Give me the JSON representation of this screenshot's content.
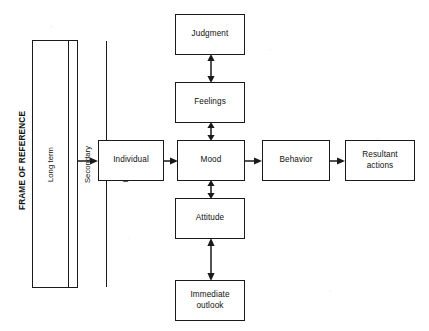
{
  "diagram": {
    "background_color": "#ffffff",
    "line_color": "#1a1a1a",
    "box_fill": "#ffffff",
    "frame": {
      "label": "FRAME OF REFERENCE",
      "columns": [
        {
          "label": "Long term"
        },
        {
          "label": "Secondary"
        },
        {
          "label": "Immediate"
        }
      ]
    },
    "boxes": {
      "judgment": {
        "label": "Judgment"
      },
      "feelings": {
        "label": "Feelings"
      },
      "individual": {
        "label": "Individual"
      },
      "mood": {
        "label": "Mood"
      },
      "behavior": {
        "label": "Behavior"
      },
      "resultant_actions": {
        "label": "Resultant\nactions"
      },
      "attitude": {
        "label": "Attitude"
      },
      "immediate_outlook": {
        "label": "Immediate\noutlook"
      }
    },
    "connectors": [
      {
        "name": "frame-to-individual",
        "from": "frame",
        "to": "individual",
        "style": "single-arrow",
        "direction": "right"
      },
      {
        "name": "individual-to-mood",
        "from": "individual",
        "to": "mood",
        "style": "single-arrow",
        "direction": "right"
      },
      {
        "name": "mood-to-behavior",
        "from": "mood",
        "to": "behavior",
        "style": "single-arrow",
        "direction": "right"
      },
      {
        "name": "behavior-to-resultant-actions",
        "from": "behavior",
        "to": "resultant_actions",
        "style": "single-arrow",
        "direction": "right"
      },
      {
        "name": "judgment-feelings",
        "from": "judgment",
        "to": "feelings",
        "style": "double-arrow",
        "direction": "vertical"
      },
      {
        "name": "feelings-mood",
        "from": "feelings",
        "to": "mood",
        "style": "double-arrow",
        "direction": "vertical"
      },
      {
        "name": "mood-attitude",
        "from": "mood",
        "to": "attitude",
        "style": "double-arrow",
        "direction": "vertical"
      },
      {
        "name": "attitude-immediate-outlook",
        "from": "attitude",
        "to": "immediate_outlook",
        "style": "double-arrow",
        "direction": "vertical"
      }
    ]
  }
}
